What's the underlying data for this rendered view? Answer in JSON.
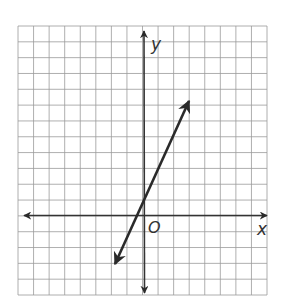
{
  "diagram": {
    "type": "coordinate-plane-graph",
    "axes": {
      "x_label": "x",
      "y_label": "y",
      "origin_label": "O"
    },
    "grid": {
      "columns": 16,
      "rows": 17,
      "cell_px": 15.6
    },
    "line": {
      "description": "straight line with arrows at both ends, positive slope",
      "approx_equation": "y = 2x + 1",
      "y_intercept": 1,
      "slope": 2
    },
    "colors": {
      "grid": "#9a9a9a",
      "axis": "#333333",
      "line": "#2a2a2a"
    }
  }
}
